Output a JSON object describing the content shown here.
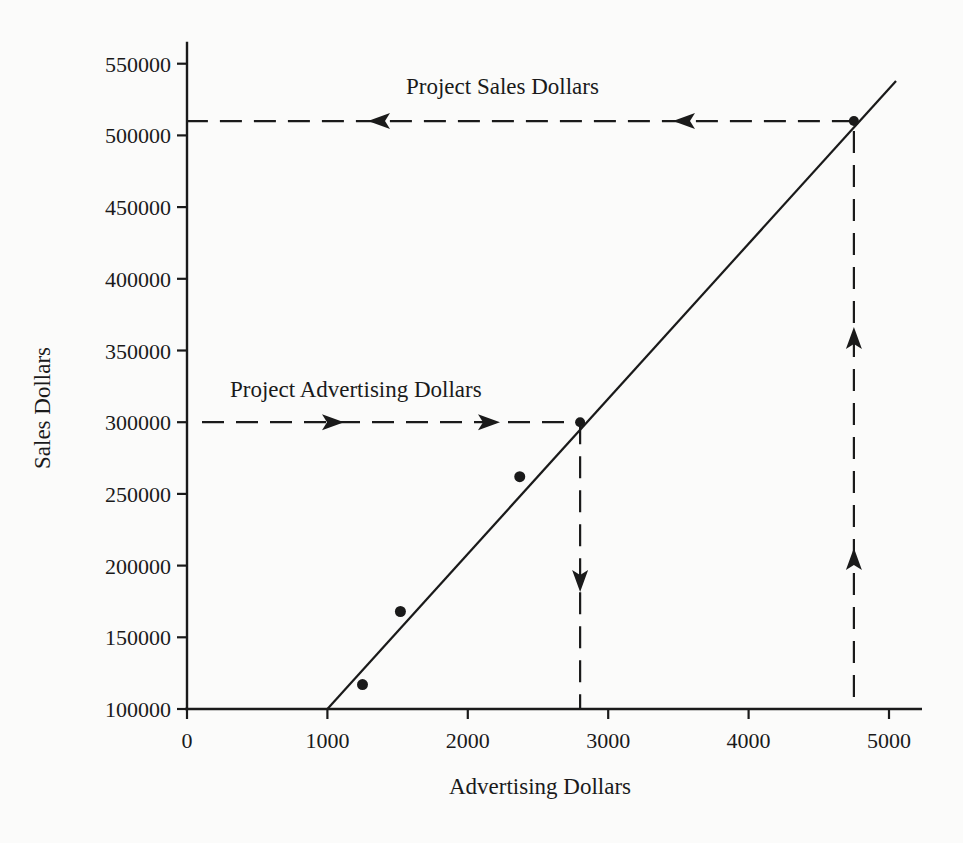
{
  "chart_data": {
    "type": "scatter",
    "title": "",
    "xlabel": "Advertising Dollars",
    "ylabel": "Sales Dollars",
    "xlim": [
      0,
      5200
    ],
    "ylim": [
      100000,
      550000
    ],
    "x_ticks": [
      0,
      1000,
      2000,
      3000,
      4000,
      5000
    ],
    "y_ticks": [
      100000,
      150000,
      200000,
      250000,
      300000,
      350000,
      400000,
      450000,
      500000,
      550000
    ],
    "grid": false,
    "legend": null,
    "series": [
      {
        "name": "Observed data",
        "kind": "scatter",
        "points": [
          {
            "x": 1250,
            "y": 117000
          },
          {
            "x": 1520,
            "y": 168000
          },
          {
            "x": 2370,
            "y": 262000
          }
        ]
      },
      {
        "name": "Regression line",
        "kind": "line",
        "points": [
          {
            "x": 1000,
            "y": 100000
          },
          {
            "x": 5050,
            "y": 538000
          }
        ]
      }
    ],
    "projections": [
      {
        "label": "Project Advertising Dollars",
        "from": {
          "x": 0,
          "y": 300000
        },
        "via": {
          "x": 2800,
          "y": 300000
        },
        "to": {
          "x": 2800,
          "y": 100000
        },
        "description": "Horizontal dashed line from y=300000 to the regression line, then dashed line down to x-axis"
      },
      {
        "label": "Project Sales Dollars",
        "from": {
          "x": 4750,
          "y": 100000
        },
        "via": {
          "x": 4750,
          "y": 510000
        },
        "to": {
          "x": 0,
          "y": 510000
        },
        "description": "Vertical dashed line from x=4750 up to the regression line, then dashed line left to y-axis"
      }
    ],
    "annotations": [
      {
        "text": "Project Sales Dollars",
        "x": 2350,
        "y": 530000
      },
      {
        "text": "Project Advertising Dollars",
        "x": 1250,
        "y": 320000
      }
    ]
  },
  "labels": {
    "x_axis_title": "Advertising Dollars",
    "y_axis_title": "Sales Dollars",
    "annotation_sales": "Project Sales Dollars",
    "annotation_advertising": "Project Advertising Dollars",
    "x_tick_labels": [
      "0",
      "1000",
      "2000",
      "3000",
      "4000",
      "5000"
    ],
    "y_tick_labels": [
      "550000",
      "500000",
      "450000",
      "400000",
      "350000",
      "300000",
      "250000",
      "200000",
      "150000",
      "100000"
    ]
  },
  "colors": {
    "ink": "#1a1a1a",
    "background": "#fbfbfa"
  }
}
